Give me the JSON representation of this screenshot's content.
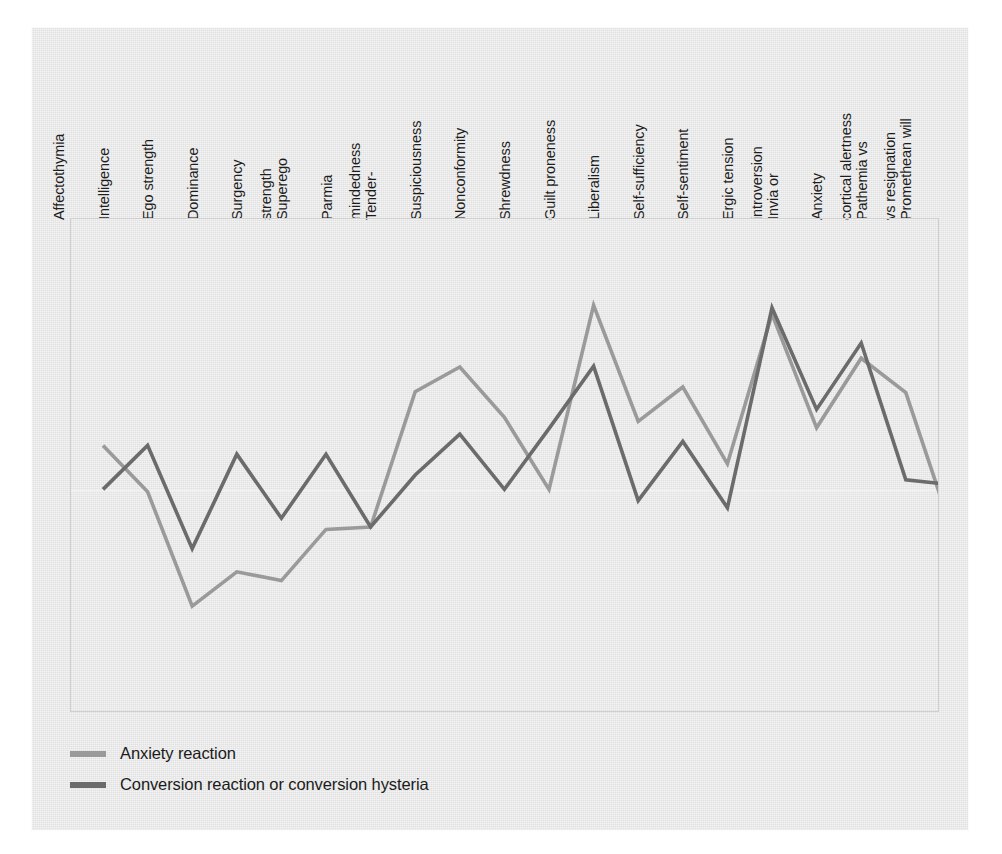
{
  "figure": {
    "background_color": "#e5e5e5",
    "page_background": "#ffffff"
  },
  "legend": {
    "position": "below-plot",
    "items": [
      {
        "label": "Anxiety reaction",
        "color": "#9a9a9a",
        "swatch_name": "legend-swatch-anxiety"
      },
      {
        "label": "Conversion reaction or conversion hysteria",
        "color": "#6b6b6b",
        "swatch_name": "legend-swatch-conversion"
      }
    ]
  },
  "chart_data": {
    "type": "line",
    "title": "",
    "subtitle": "",
    "xlabel": "",
    "ylabel": "",
    "grid": true,
    "gridlines": [
      "zero-reference line at mid-plot"
    ],
    "legend_position": "bottom-left",
    "ylim": [
      -3.2,
      3.2
    ],
    "categories": [
      "Affectothymia",
      "Intelligence",
      "Ego strength",
      "Dominance",
      "Surgency",
      "Superego strength",
      "Parmia",
      "Tender-mindedness",
      "Suspiciousness",
      "Nonconformity",
      "Shrewdness",
      "Guilt proneness",
      "Liberalism",
      "Self-sufficiency",
      "Self-sentiment",
      "Ergic tension",
      "Invia or introversion",
      "Anxiety",
      "Pathemia vs cortical alertness",
      "Promethean will vs resignation"
    ],
    "categories_lines": [
      [
        "Affectothymia"
      ],
      [
        "Intelligence"
      ],
      [
        "Ego strength"
      ],
      [
        "Dominance"
      ],
      [
        "Surgency"
      ],
      [
        "Superego",
        "strength"
      ],
      [
        "Parmia"
      ],
      [
        "Tender-",
        "mindedness"
      ],
      [
        "Suspiciousness"
      ],
      [
        "Nonconformity"
      ],
      [
        "Shrewdness"
      ],
      [
        "Guilt proneness"
      ],
      [
        "Liberalism"
      ],
      [
        "Self-sufficiency"
      ],
      [
        "Self-sentiment"
      ],
      [
        "Ergic tension"
      ],
      [
        "Invia or",
        "introversion"
      ],
      [
        "Anxiety"
      ],
      [
        "Pathemia vs",
        "cortical alertness"
      ],
      [
        "Promethean will",
        "vs resignation"
      ]
    ],
    "series": [
      {
        "name": "Anxiety reaction",
        "color": "#9a9a9a",
        "values": [
          0.57,
          -0.01,
          -1.44,
          -1.01,
          -1.12,
          -0.48,
          -0.45,
          1.24,
          1.55,
          0.92,
          0.02,
          2.32,
          0.87,
          1.3,
          0.34,
          2.21,
          0.79,
          1.66,
          1.23,
          -0.44
        ]
      },
      {
        "name": "Conversion reaction or conversion hysteria",
        "color": "#6b6b6b",
        "values": [
          0.02,
          0.57,
          -0.72,
          0.46,
          -0.34,
          0.46,
          -0.45,
          0.2,
          0.71,
          0.02,
          0.78,
          1.56,
          -0.12,
          0.62,
          -0.21,
          2.29,
          1.02,
          1.85,
          0.14,
          0.08
        ]
      }
    ]
  }
}
